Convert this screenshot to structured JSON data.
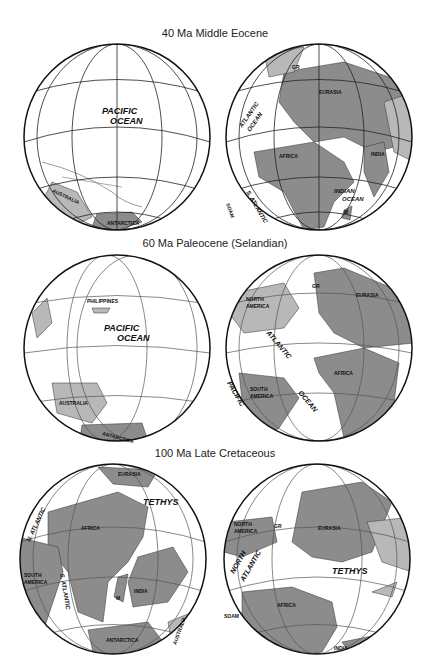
{
  "colors": {
    "land_dark": "#8c8c8c",
    "land_light": "#b8b8b8",
    "ocean": "#ffffff",
    "grid": "#222222"
  },
  "panels": [
    {
      "title": "40 Ma Middle Eocene",
      "left_globe": {
        "labels": {
          "ocean1": "PACIFIC",
          "ocean2": "OCEAN",
          "c1": "AUSTRALIA",
          "c2": "ANTARCTICA"
        }
      },
      "right_globe": {
        "labels": {
          "o1": "ATLANTIC",
          "o2": "OCEAN",
          "o3": "S. ATLANTIC",
          "o4": "INDIAN",
          "o5": "OCEAN",
          "c1": "EURASIA",
          "c2": "AFRICA",
          "c3": "INDIA",
          "c4": "GR",
          "c5": "SOAM",
          "c6": "M"
        }
      }
    },
    {
      "title": "60 Ma Paleocene (Selandian)",
      "left_globe": {
        "labels": {
          "ocean1": "PACIFIC",
          "ocean2": "OCEAN",
          "c1": "PHILIPPINES",
          "c2": "AUSTRALIA",
          "c3": "ANTARCTICA"
        }
      },
      "right_globe": {
        "labels": {
          "o1": "ATLANTIC",
          "o2": "OCEAN",
          "o3": "PACIFIC",
          "c1": "NORTH",
          "c1b": "AMERICA",
          "c2": "GR",
          "c3": "EURASIA",
          "c4": "AFRICA",
          "c5": "SOUTH",
          "c5b": "AMERICA"
        }
      }
    },
    {
      "title": "100 Ma Late Cretaceous",
      "left_globe": {
        "labels": {
          "o1": "TETHYS",
          "o2": "N. ATLANTIC",
          "o3": "S. ATLANTIC",
          "c1": "EURASIA",
          "c2": "AFRICA",
          "c3": "SOUTH",
          "c3b": "AMERICA",
          "c4": "INDIA",
          "c5": "M",
          "c6": "ANTARCTICA",
          "c7": "AUSTRALIA"
        }
      },
      "right_globe": {
        "labels": {
          "o1": "TETHYS",
          "o2": "NORTH",
          "o3": "ATLANTIC",
          "c1": "NORTH",
          "c1b": "AMERICA",
          "c2": "GR",
          "c3": "EURASIA",
          "c4": "AFRICA",
          "c5": "SOAM",
          "c6": "INDIA"
        }
      }
    }
  ]
}
